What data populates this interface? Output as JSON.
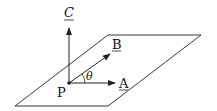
{
  "diagram": {
    "point_label": "P",
    "vectors": [
      {
        "name": "A",
        "label": "A"
      },
      {
        "name": "B",
        "label": "B"
      },
      {
        "name": "C",
        "label": "C"
      }
    ],
    "angle_label": "θ",
    "colors": {
      "line": "#222222",
      "background": "#ffffff"
    }
  }
}
